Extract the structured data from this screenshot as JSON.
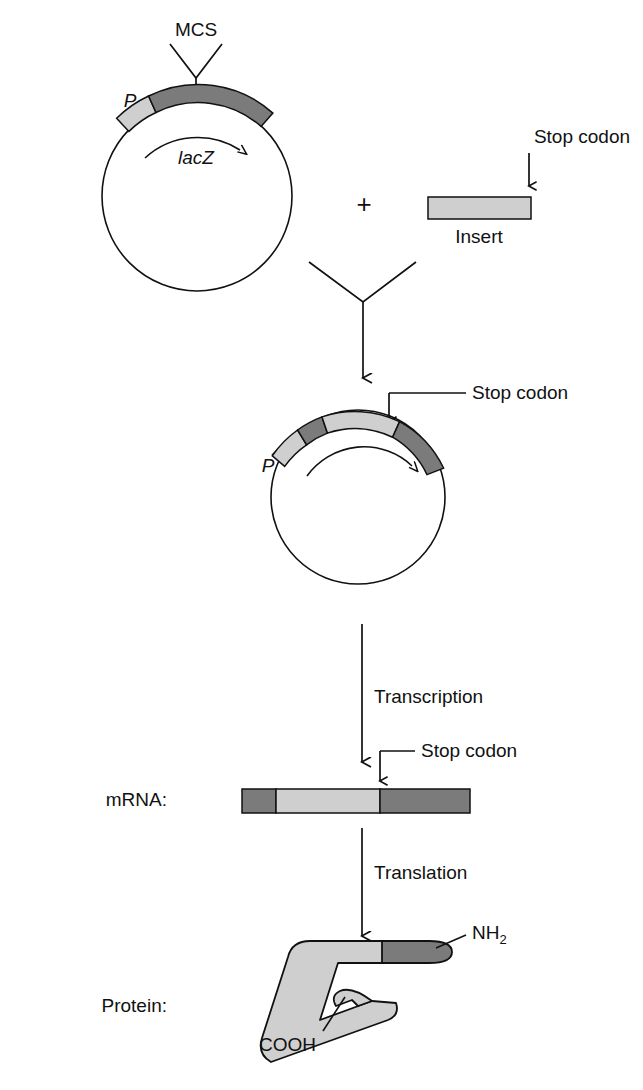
{
  "figure": {
    "colors": {
      "dark_gray": "#7b7b7b",
      "light_gray": "#cfcfcf",
      "outline": "#111111",
      "background": "#ffffff"
    }
  },
  "labels": {
    "mcs": "MCS",
    "promoter": "P",
    "lacz": "lacZ",
    "plus": "+",
    "stop_codon_insert": "Stop codon",
    "insert": "Insert",
    "promoter2": "P",
    "stop_codon_plasmid": "Stop codon",
    "transcription": "Transcription",
    "stop_codon_mrna": "Stop codon",
    "mrna_label": "mRNA:",
    "translation": "Translation",
    "protein_label": "Protein:",
    "nh2": "NH",
    "nh2_sub": "2",
    "cooh": "COOH"
  },
  "plasmid_top": {
    "name": "parent-plasmid",
    "segments": [
      {
        "name": "promoter",
        "shade": "light_gray"
      },
      {
        "name": "lacZ-coding",
        "shade": "dark_gray"
      }
    ],
    "direction_arrow": "clockwise"
  },
  "insert_fragment": {
    "name": "insert-dna-fragment",
    "shade": "light_gray",
    "stop_codon_at": "right-end"
  },
  "plasmid_recombinant": {
    "name": "recombinant-plasmid",
    "segments": [
      {
        "name": "promoter",
        "shade": "light_gray"
      },
      {
        "name": "lacZ-5prime",
        "shade": "dark_gray"
      },
      {
        "name": "insert",
        "shade": "light_gray"
      },
      {
        "name": "lacZ-3prime",
        "shade": "dark_gray"
      }
    ],
    "direction_arrow": "clockwise"
  },
  "mrna": {
    "name": "mrna-transcript",
    "segments": [
      {
        "name": "lacZ-5prime",
        "shade": "dark_gray"
      },
      {
        "name": "insert",
        "shade": "light_gray"
      },
      {
        "name": "lacZ-3prime",
        "shade": "dark_gray"
      }
    ],
    "stop_codon_position": "end-of-insert"
  },
  "protein": {
    "name": "fusion-protein",
    "body_shade": "light_gray",
    "n_terminal_shade": "dark_gray",
    "termini": [
      "NH2",
      "COOH"
    ]
  }
}
